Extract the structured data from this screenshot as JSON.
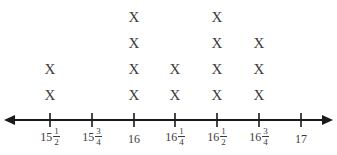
{
  "chart_data": {
    "type": "line-plot",
    "title": "",
    "xlabel": "",
    "ylabel": "",
    "marker": "X",
    "categories": [
      "15 1/2",
      "15 3/4",
      "16",
      "16 1/4",
      "16 1/2",
      "16 3/4",
      "17"
    ],
    "x": [
      15.5,
      15.75,
      16,
      16.25,
      16.5,
      16.75,
      17
    ],
    "values": [
      2,
      0,
      4,
      2,
      4,
      3,
      0
    ],
    "xlim": [
      15.5,
      17
    ],
    "grid": false,
    "legend": "none"
  },
  "axis": {
    "ticks": [
      {
        "whole": "15",
        "num": "1",
        "den": "2"
      },
      {
        "whole": "15",
        "num": "3",
        "den": "4"
      },
      {
        "whole": "16",
        "num": "",
        "den": ""
      },
      {
        "whole": "16",
        "num": "1",
        "den": "4"
      },
      {
        "whole": "16",
        "num": "1",
        "den": "2"
      },
      {
        "whole": "16",
        "num": "3",
        "den": "4"
      },
      {
        "whole": "17",
        "num": "",
        "den": ""
      }
    ]
  },
  "marker_text": "X",
  "colors": {
    "axis": "#1a1a1a",
    "text": "#3c3c3c",
    "background": "#ffffff"
  }
}
